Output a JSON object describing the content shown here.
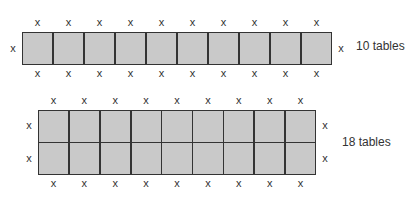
{
  "diagram": {
    "title": "",
    "fill_color": "#c9c9c9",
    "line_color": "#333333",
    "marker": "x",
    "arrangements": [
      {
        "label": "10 tables",
        "rows": 1,
        "cols": 10,
        "seats_top": 10,
        "seats_bottom": 10,
        "seats_left": 1,
        "seats_right": 1
      },
      {
        "label": "18 tables",
        "rows": 2,
        "cols": 9,
        "seats_top": 9,
        "seats_bottom": 9,
        "seats_left": 2,
        "seats_right": 2
      }
    ]
  }
}
